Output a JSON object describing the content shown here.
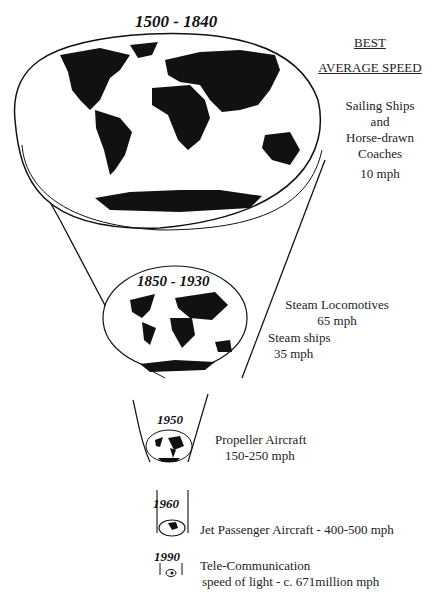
{
  "header": {
    "line1": "BEST",
    "line2": "AVERAGE SPEED"
  },
  "eras": [
    {
      "period": "1500 - 1840",
      "modes": [
        "Sailing Ships",
        "and",
        "Horse-drawn",
        "Coaches"
      ],
      "speed": "10 mph"
    },
    {
      "period": "1850 - 1930",
      "modes_a": "Steam Locomotives",
      "speed_a": "65 mph",
      "modes_b": "Steam ships",
      "speed_b": "35 mph"
    },
    {
      "period": "1950",
      "mode": "Propeller Aircraft",
      "speed": "150-250 mph"
    },
    {
      "period": "1960",
      "mode": "Jet Passenger Aircraft - 400-500 mph"
    },
    {
      "period": "1990",
      "mode": "Tele-Communication",
      "speed": "speed of light - c. 671million mph"
    }
  ],
  "icons": [
    "world-map-icon",
    "world-map-icon",
    "world-map-icon",
    "world-map-icon",
    "world-map-icon"
  ]
}
